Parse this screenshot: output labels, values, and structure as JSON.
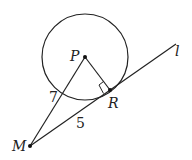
{
  "diagram": {
    "type": "geometry",
    "points": {
      "P": {
        "label": "P",
        "x": 85,
        "y": 57
      },
      "R": {
        "label": "R",
        "x": 110,
        "y": 90
      },
      "M": {
        "label": "M",
        "x": 30,
        "y": 146
      }
    },
    "line_label": "l",
    "lengths": {
      "PM": "7",
      "MR": "5"
    },
    "colors": {
      "stroke": "#222222",
      "background": "#ffffff"
    }
  }
}
